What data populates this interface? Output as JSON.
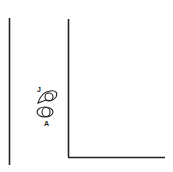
{
  "diagram": {
    "labels": {
      "top_figure": "J",
      "bottom_figure": "A"
    },
    "colors": {
      "stroke": "#222222",
      "background": "#ffffff"
    }
  }
}
